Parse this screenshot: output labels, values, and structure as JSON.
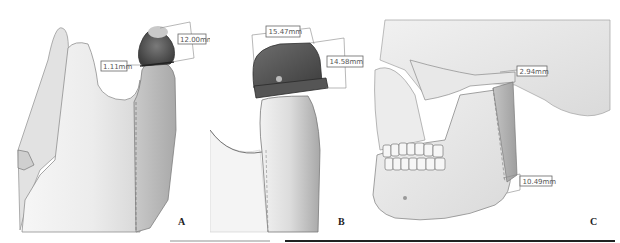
{
  "figure": {
    "panels": [
      {
        "letter": "A",
        "measurements": [
          {
            "label": "12.00mm",
            "dimension": "condyle height"
          },
          {
            "label": "1.11mm",
            "dimension": "gap"
          }
        ]
      },
      {
        "letter": "B",
        "measurements": [
          {
            "label": "15.47mm",
            "dimension": "width"
          },
          {
            "label": "14.58mm",
            "dimension": "height"
          }
        ]
      },
      {
        "letter": "C",
        "measurements": [
          {
            "label": "2.94mm",
            "dimension": "condylar gap"
          },
          {
            "label": "10.49mm",
            "dimension": "ramus offset"
          }
        ]
      }
    ]
  },
  "colors": {
    "bone_light": "#ececec",
    "bone_shade": "#bdbdbd",
    "bone_dark": "#8a8a8a",
    "prosthesis_dark": "#4a4a4a",
    "prosthesis_mid": "#6b6b6b",
    "annotation": "#666666"
  }
}
